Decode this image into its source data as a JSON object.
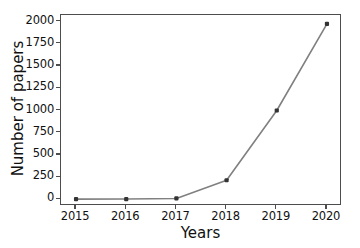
{
  "chart_data": {
    "type": "line",
    "title": "",
    "xlabel": "Years",
    "ylabel": "Number of papers",
    "categories": [
      "2015",
      "2016",
      "2017",
      "2018",
      "2019",
      "2020"
    ],
    "x": [
      2015,
      2016,
      2017,
      2018,
      2019,
      2020
    ],
    "values": [
      2,
      3,
      10,
      215,
      1000,
      1975
    ],
    "series": [
      {
        "name": "Number of papers",
        "values": [
          2,
          3,
          10,
          215,
          1000,
          1975
        ]
      }
    ],
    "xlim": [
      2014.7,
      2020.3
    ],
    "ylim": [
      -75,
      2075
    ],
    "yticks": [
      0,
      250,
      500,
      750,
      1000,
      1250,
      1500,
      1750,
      2000
    ],
    "ytick_labels": [
      "0",
      "250",
      "500",
      "750",
      "1000",
      "1250",
      "1500",
      "1750",
      "2000"
    ],
    "xticks": [
      2015,
      2016,
      2017,
      2018,
      2019,
      2020
    ],
    "xtick_labels": [
      "2015",
      "2016",
      "2017",
      "2018",
      "2019",
      "2020"
    ],
    "grid": false,
    "legend": "none",
    "line_color": "#808080",
    "marker_color": "#333333",
    "marker": "square",
    "axes_color": "#4d4d4d",
    "background": "#ffffff"
  }
}
